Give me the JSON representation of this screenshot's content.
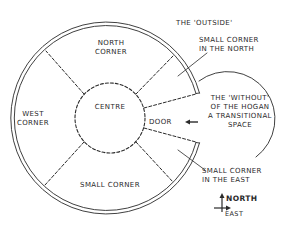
{
  "diagram": {
    "colors": {
      "ink": "#2a2a2a",
      "background": "#ffffff"
    },
    "regions": {
      "north_corner": [
        "NORTH",
        "CORNER"
      ],
      "west_corner": [
        "WEST",
        "CORNER"
      ],
      "centre": "CENTRE",
      "small_corner": "SMALL CORNER",
      "door": "DOOR"
    },
    "annotations": {
      "outside": "THE 'OUTSIDE'",
      "small_corner_north": [
        "SMALL CORNER",
        "IN THE NORTH"
      ],
      "without": [
        "THE 'WITHOUT'",
        "OF THE HOGAN",
        "A TRANSITIONAL",
        "SPACE"
      ],
      "small_corner_east": [
        "SMALL CORNER",
        "IN THE EAST"
      ]
    },
    "compass": {
      "north": "NORTH",
      "east": "EAST"
    },
    "icons": [
      "door-arrow-icon",
      "compass-icon"
    ]
  }
}
